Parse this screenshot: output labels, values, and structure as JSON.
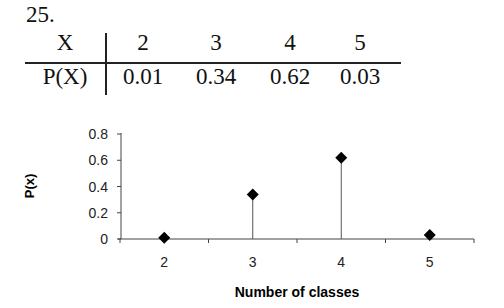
{
  "problem_number": "25.",
  "table": {
    "row_headers": [
      "X",
      "P(X)"
    ],
    "x_values": [
      "2",
      "3",
      "4",
      "5"
    ],
    "p_values": [
      "0.01",
      "0.34",
      "0.62",
      "0.03"
    ]
  },
  "chart_data": {
    "type": "scatter",
    "style": "stem plot with diamond markers",
    "x": [
      2,
      3,
      4,
      5
    ],
    "values": [
      0.01,
      0.34,
      0.62,
      0.03
    ],
    "categories": [
      "2",
      "3",
      "4",
      "5"
    ],
    "title": "",
    "xlabel": "Number of classes",
    "ylabel": "P(x)",
    "ylim": [
      0,
      0.8
    ],
    "yticks": [
      "0",
      "0.2",
      "0.4",
      "0.6",
      "0.8"
    ],
    "grid": false,
    "legend": "none",
    "marker_color": "#000000"
  }
}
